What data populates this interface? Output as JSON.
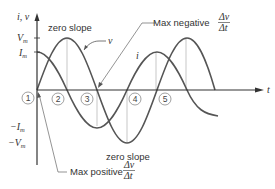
{
  "diagram": {
    "axes": {
      "y_label": "i, v",
      "x_label": "t",
      "y_ticks": [
        {
          "label": "V",
          "sub": "m",
          "y": 38
        },
        {
          "label": "I",
          "sub": "m",
          "y": 52
        },
        {
          "label": "−I",
          "sub": "m",
          "y": 127
        },
        {
          "label": "−V",
          "sub": "m",
          "y": 143
        }
      ]
    },
    "curves": {
      "v_label": "v",
      "i_label": "i"
    },
    "annotations": {
      "zero_slope_top": "zero slope",
      "zero_slope_bottom": "zero slope",
      "max_negative": "Max negative",
      "max_positive": "Max positive",
      "frac_num": "Δv",
      "frac_den": "Δt"
    },
    "markers": [
      "1",
      "2",
      "3",
      "4",
      "5"
    ],
    "colors": {
      "curve": "#555555",
      "axis": "#333333",
      "guide": "#aaaaaa"
    }
  }
}
